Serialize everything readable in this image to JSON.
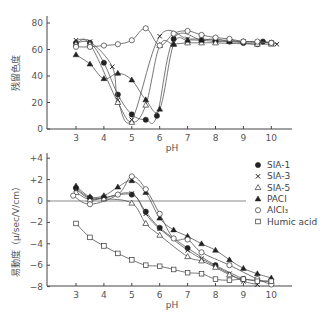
{
  "chart_data": [
    {
      "type": "line",
      "title": "",
      "xlabel": "pH",
      "ylabel": "残留色度",
      "xlim": [
        2.3,
        10.7
      ],
      "ylim": [
        0,
        85
      ],
      "xticks": [
        3,
        4,
        5,
        6,
        7,
        8,
        9,
        10
      ],
      "xtick_labels": [
        "3",
        "4",
        "5",
        "6",
        "7",
        "8",
        "9",
        "10"
      ],
      "yticks": [
        0,
        20,
        40,
        60,
        80
      ],
      "ytick_labels": [
        "0",
        "20",
        "40",
        "60",
        "80"
      ],
      "grid": false,
      "series": [
        {
          "name": "SIA-1",
          "marker": "filled-circle",
          "x": [
            3,
            3.5,
            4,
            4.5,
            5,
            5.5,
            5.9,
            6.5,
            7.5,
            8,
            8.5,
            9,
            9.5,
            9.7,
            10
          ],
          "y": [
            65,
            65,
            50,
            26,
            11,
            7,
            10,
            68,
            67,
            66,
            66,
            65,
            64,
            66,
            65
          ]
        },
        {
          "name": "SIA-3",
          "marker": "cross",
          "x": [
            3,
            3.5,
            4.3,
            4.5,
            5,
            6,
            7,
            7.5,
            8,
            8.5,
            9,
            10,
            10.2
          ],
          "y": [
            67,
            66,
            47,
            22,
            7,
            70,
            68,
            68,
            67,
            67,
            66,
            65,
            64
          ]
        },
        {
          "name": "SIA-5",
          "marker": "open-triangle",
          "x": [
            3,
            3.5,
            4.5,
            5,
            5.5,
            6,
            6.5,
            7,
            7.5,
            8,
            9.5,
            10
          ],
          "y": [
            64,
            64,
            20,
            5,
            18,
            63,
            64,
            65,
            65,
            65,
            64,
            64
          ]
        },
        {
          "name": "PACl",
          "marker": "filled-triangle",
          "x": [
            3,
            3.5,
            4,
            4.5,
            5,
            5.5,
            6,
            6.5,
            7,
            7.5,
            8,
            8.5,
            9,
            10
          ],
          "y": [
            56,
            49,
            38,
            42,
            37,
            22,
            15,
            64,
            67,
            67,
            68,
            66,
            66,
            65
          ]
        },
        {
          "name": "AlCl3",
          "marker": "open-circle",
          "x": [
            3,
            3.5,
            4,
            4.5,
            5,
            5.5,
            6,
            6.5,
            7,
            7.5,
            8,
            8.5,
            9,
            9.5,
            10
          ],
          "y": [
            62,
            62,
            63,
            64,
            67,
            76,
            63,
            72,
            74,
            71,
            69,
            68,
            66,
            66,
            65
          ]
        }
      ]
    },
    {
      "type": "line",
      "title": "",
      "xlabel": "pH",
      "ylabel": "易動度（μ/sec/V/cm）",
      "xlim": [
        2.3,
        10.7
      ],
      "ylim": [
        -8,
        4.5
      ],
      "xticks": [
        3,
        4,
        5,
        6,
        7,
        8,
        9,
        10
      ],
      "xtick_labels": [
        "3",
        "4",
        "5",
        "6",
        "7",
        "8",
        "9",
        "10"
      ],
      "yticks": [
        4,
        2,
        0,
        -2,
        -4,
        -6,
        -8
      ],
      "ytick_labels": [
        "+4",
        "+2",
        "0",
        "−2",
        "−4",
        "−6",
        "−8"
      ],
      "grid": false,
      "reference_line_y": 0,
      "legend_position": "right",
      "series": [
        {
          "name": "SIA-1",
          "marker": "filled-circle",
          "x": [
            3,
            3.5,
            4,
            5,
            5.5,
            6,
            7,
            8,
            9
          ],
          "y": [
            1.2,
            0.3,
            0.3,
            0.6,
            -1.0,
            -2.5,
            -4.4,
            -6.0,
            -7.3
          ]
        },
        {
          "name": "SIA-3",
          "marker": "cross",
          "x": [
            3,
            3.5,
            4,
            5,
            5.5,
            6,
            7,
            7.5,
            8,
            8.5,
            9,
            9.5
          ],
          "y": [
            1.1,
            0.2,
            0.3,
            0.7,
            -1.2,
            -2.6,
            -4.6,
            -5.4,
            -6.1,
            -6.8,
            -7.5,
            -7.8
          ]
        },
        {
          "name": "SIA-5",
          "marker": "open-triangle",
          "x": [
            3,
            3.5,
            4,
            5,
            5.5,
            6,
            7,
            7.5,
            8,
            8.5,
            9,
            10
          ],
          "y": [
            0.8,
            0.1,
            0.2,
            -0.2,
            -2.1,
            -3.2,
            -5.2,
            -5.6,
            -6.2,
            -6.9,
            -7.3,
            -7.5
          ]
        },
        {
          "name": "PACl",
          "marker": "filled-triangle",
          "x": [
            3,
            3.5,
            4,
            4.5,
            5,
            5.5,
            6,
            6.5,
            7,
            7.5,
            8,
            8.5,
            9,
            9.5,
            10
          ],
          "y": [
            1.4,
            0.4,
            0.5,
            1.3,
            1.9,
            0.8,
            -1.6,
            -2.7,
            -3.3,
            -4.0,
            -4.6,
            -5.5,
            -6.3,
            -6.8,
            -7.2
          ]
        },
        {
          "name": "AlCl3",
          "marker": "open-circle",
          "x": [
            2.9,
            3.5,
            4.5,
            5,
            5.5,
            6,
            6.5,
            7,
            7.5,
            8.5,
            9.5,
            10
          ],
          "y": [
            0.5,
            -0.3,
            0.6,
            2.3,
            1.1,
            -1.2,
            -3.5,
            -3.6,
            -4.8,
            -6.0,
            -7.3,
            -7.8
          ]
        },
        {
          "name": "Humic acid",
          "marker": "open-square",
          "x": [
            3,
            3.5,
            4,
            4.5,
            5,
            5.5,
            6,
            6.5,
            7,
            7.5,
            8,
            8.5,
            9,
            9.5,
            10
          ],
          "y": [
            -2.1,
            -3.4,
            -4.2,
            -4.9,
            -5.5,
            -6.0,
            -6.1,
            -6.4,
            -6.7,
            -6.8,
            -7.3,
            -7.4,
            -7.3,
            -7.5,
            -7.5
          ]
        }
      ]
    }
  ],
  "legend": [
    {
      "label": "SIA-1",
      "marker": "filled-circle"
    },
    {
      "label": "SIA-3",
      "marker": "cross"
    },
    {
      "label": "SIA-5",
      "marker": "open-triangle"
    },
    {
      "label": "PACl",
      "marker": "filled-triangle"
    },
    {
      "label": "AlCl₃",
      "marker": "open-circle"
    },
    {
      "label": "Humic acid",
      "marker": "open-square"
    }
  ]
}
